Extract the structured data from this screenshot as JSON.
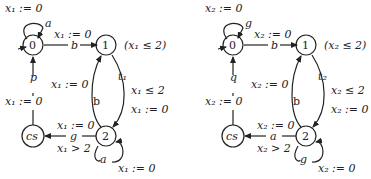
{
  "automata": [
    {
      "id": "A1",
      "states": {
        "s0": "0",
        "s1": "1",
        "s2": "2",
        "cs": "cs"
      },
      "invariant_s1": "(x₁ ≤ 2)",
      "edges": {
        "loop0_action": "a",
        "loop0_reset": "x₁ := 0",
        "e01_action": "b",
        "e01_reset": "x₁ := 0",
        "e12_action": "t₁",
        "e12_guard": "x₁ ≤ 2",
        "e12_reset": "x₁ := 0",
        "e21_action": "b",
        "e21_reset": "x₁ := 0",
        "e2cs_action": "g",
        "e2cs_reset": "x₁ := 0",
        "e2cs_guard": "x₁ > 2",
        "loop2_action": "a",
        "loop2_reset": "x₁ := 0",
        "ecs0_action": "p",
        "ecs0_reset": "x₁ := 0"
      }
    },
    {
      "id": "A2",
      "states": {
        "s0": "0",
        "s1": "1",
        "s2": "2",
        "cs": "cs"
      },
      "invariant_s1": "(x₂ ≤ 2)",
      "edges": {
        "loop0_action": "g",
        "loop0_reset": "x₂ := 0",
        "e01_action": "b",
        "e01_reset": "x₂ := 0",
        "e12_action": "t₂",
        "e12_guard": "x₂ ≤ 2",
        "e12_reset": "x₂ := 0",
        "e21_action": "b",
        "e21_reset": "x₂ := 0",
        "e2cs_action": "a",
        "e2cs_reset": "x₂ := 0",
        "e2cs_guard": "x₂ > 2",
        "loop2_action": "g",
        "loop2_reset": "x₂ := 0",
        "ecs0_action": "q",
        "ecs0_reset": "x₂ := 0"
      }
    }
  ]
}
